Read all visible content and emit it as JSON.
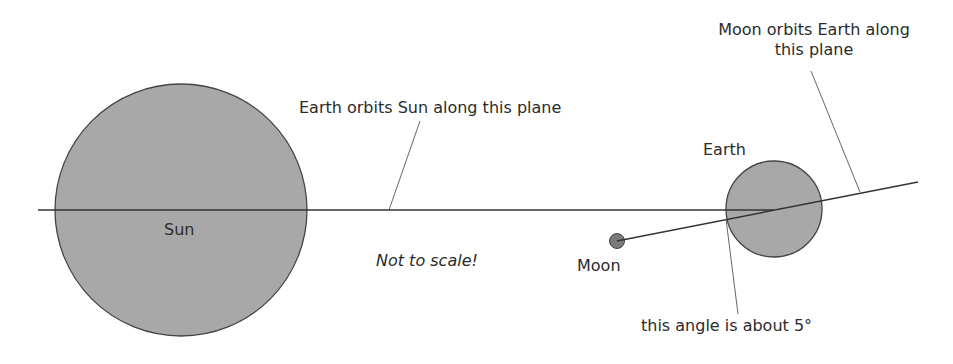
{
  "diagram": {
    "colors": {
      "body_fill": "#a8a8a8",
      "moon_fill": "#7a7a7a",
      "line": "#333333",
      "text": "#2b2b2b",
      "background": "#ffffff"
    },
    "bodies": {
      "sun": {
        "label": "Sun"
      },
      "earth": {
        "label": "Earth"
      },
      "moon": {
        "label": "Moon"
      }
    },
    "annotations": {
      "earth_orbit_plane": "Earth orbits Sun along this plane",
      "moon_orbit_plane_line1": "Moon orbits Earth along",
      "moon_orbit_plane_line2": "this plane",
      "angle": "this angle is about 5°",
      "scale_note": "Not to scale!"
    }
  }
}
